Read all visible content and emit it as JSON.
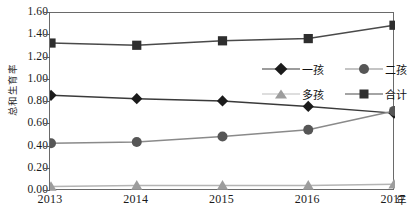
{
  "chart_data": {
    "type": "line",
    "title": "",
    "subtitle": "",
    "xlabel": "年",
    "ylabel": "总和生育率",
    "x": [
      "2013",
      "2014",
      "2015",
      "2016",
      "2017"
    ],
    "categories": [
      "2013",
      "2014",
      "2015",
      "2016",
      "2017"
    ],
    "xlim": [
      2013,
      2017
    ],
    "ylim": [
      0.0,
      1.6
    ],
    "ytick_labels": [
      "0.00",
      "0.20",
      "0.40",
      "0.60",
      "0.80",
      "1.00",
      "1.20",
      "1.40",
      "1.60"
    ],
    "ytick_values": [
      0.0,
      0.2,
      0.4,
      0.6,
      0.8,
      1.0,
      1.2,
      1.4,
      1.6
    ],
    "grid": false,
    "legend_position": "upper-right-inside",
    "series": [
      {
        "name": "一孩",
        "marker": "diamond",
        "color": "#1b1b1b",
        "line_color": "#3a3a3a",
        "values": [
          0.86,
          0.83,
          0.81,
          0.76,
          0.7
        ]
      },
      {
        "name": "二孩",
        "marker": "circle",
        "color": "#565656",
        "line_color": "#8a8a8a",
        "values": [
          0.43,
          0.44,
          0.49,
          0.55,
          0.72
        ]
      },
      {
        "name": "多孩",
        "marker": "triangle",
        "color": "#9d9d9d",
        "line_color": "#b4b4b4",
        "values": [
          0.04,
          0.05,
          0.05,
          0.05,
          0.06
        ]
      },
      {
        "name": "合计",
        "marker": "square",
        "color": "#2e2e2e",
        "line_color": "#4a4a4a",
        "values": [
          1.33,
          1.31,
          1.35,
          1.37,
          1.49
        ]
      }
    ]
  },
  "axis": {
    "y_title": "总和生育率",
    "x_unit": "年"
  },
  "legend": {
    "items": [
      {
        "label": "一孩"
      },
      {
        "label": "二孩"
      },
      {
        "label": "多孩"
      },
      {
        "label": "合计"
      }
    ]
  }
}
